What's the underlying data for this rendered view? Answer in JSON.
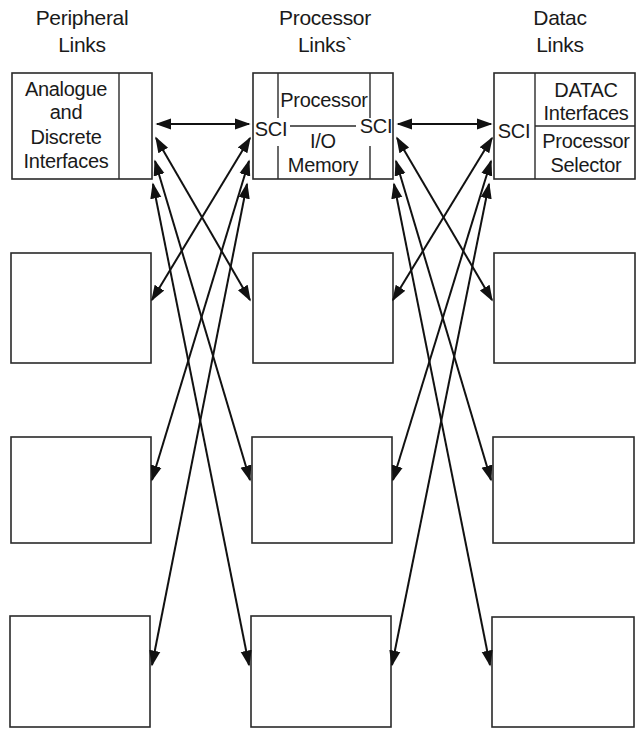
{
  "headers": {
    "peripheral": {
      "line1": "Peripheral",
      "line2": "Links"
    },
    "processor": {
      "line1": "Processor",
      "line2": "Links`"
    },
    "datac": {
      "line1": "Datac",
      "line2": "Links"
    }
  },
  "boxes": {
    "peripheral_top": {
      "lines": [
        "Analogue",
        "and",
        "Discrete",
        "Interfaces"
      ]
    },
    "processor_top": {
      "left_port": "SCI",
      "right_port": "SCI",
      "upper": "Processor",
      "middle": "I/O",
      "lower": "Memory"
    },
    "datac_top": {
      "port": "SCI",
      "upper_lines": [
        "DATAC",
        "Interfaces"
      ],
      "lower_lines": [
        "Processor",
        "Selector"
      ]
    }
  },
  "structure": {
    "columns": [
      "Peripheral Links",
      "Processor Links",
      "Datac Links"
    ],
    "rows": 4,
    "empty_boxes_per_column": 3,
    "connections": [
      {
        "from": "peripheral_top",
        "to": "processor_top",
        "type": "bidirectional"
      },
      {
        "from": "peripheral_top",
        "to": "processor_row2",
        "type": "bidirectional"
      },
      {
        "from": "peripheral_top",
        "to": "processor_row3",
        "type": "bidirectional"
      },
      {
        "from": "peripheral_top",
        "to": "processor_row4",
        "type": "bidirectional"
      },
      {
        "from": "processor_top",
        "to": "peripheral_row2",
        "type": "bidirectional"
      },
      {
        "from": "processor_top",
        "to": "peripheral_row3",
        "type": "bidirectional"
      },
      {
        "from": "processor_top",
        "to": "peripheral_row4",
        "type": "bidirectional"
      },
      {
        "from": "processor_top",
        "to": "datac_top",
        "type": "bidirectional"
      },
      {
        "from": "processor_top",
        "to": "datac_row2",
        "type": "bidirectional"
      },
      {
        "from": "processor_top",
        "to": "datac_row3",
        "type": "bidirectional"
      },
      {
        "from": "processor_top",
        "to": "datac_row4",
        "type": "bidirectional"
      },
      {
        "from": "datac_top",
        "to": "processor_row2",
        "type": "bidirectional"
      },
      {
        "from": "datac_top",
        "to": "processor_row3",
        "type": "bidirectional"
      },
      {
        "from": "datac_top",
        "to": "processor_row4",
        "type": "bidirectional"
      }
    ]
  },
  "colors": {
    "line": "#111111",
    "background": "#ffffff"
  }
}
